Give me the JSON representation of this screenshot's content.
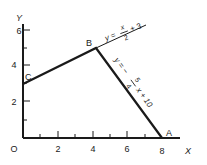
{
  "diagram": {
    "type": "linear-programming-feasible-region",
    "axes": {
      "x_label": "X",
      "y_label": "Y",
      "origin_label": "O",
      "x_ticks": [
        "2",
        "4",
        "6",
        "8"
      ],
      "y_ticks": [
        "2",
        "4",
        "6"
      ]
    },
    "points": {
      "A": {
        "label": "A",
        "x": 8,
        "y": 0
      },
      "B": {
        "label": "B",
        "x": 4,
        "y": 5
      },
      "C": {
        "label": "C",
        "x": 0,
        "y": 3
      }
    },
    "lines": [
      {
        "name": "line-CB",
        "equation_lhs": "y =",
        "numerator": "x",
        "denominator": "2",
        "tail": "+ 3"
      },
      {
        "name": "line-BA",
        "equation_lhs": "y = −",
        "numerator": "5",
        "denominator": "4",
        "tail": "x + 10"
      }
    ]
  },
  "colors": {
    "ink": "#1a1a1a",
    "background": "#ffffff"
  }
}
